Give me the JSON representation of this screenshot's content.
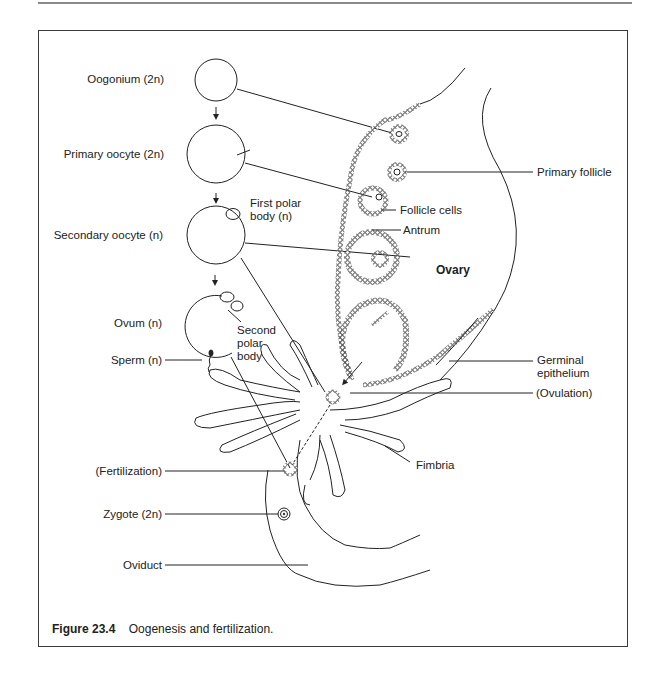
{
  "figure": {
    "number": "Figure 23.4",
    "caption": "Oogenesis and fertilization."
  },
  "stages": [
    {
      "label": "Oogonium (2n)"
    },
    {
      "label": "Primary oocyte (2n)"
    },
    {
      "label": "Secondary oocyte (n)"
    },
    {
      "label": "Ovum (n)"
    },
    {
      "label": "Sperm (n)"
    },
    {
      "label": "(Fertilization)"
    },
    {
      "label": "Zygote (2n)"
    },
    {
      "label": "Oviduct"
    }
  ],
  "annotations": {
    "first_polar_body": [
      "First polar",
      "body (n)"
    ],
    "second_polar_body": [
      "Second",
      "polar",
      "body"
    ],
    "primary_follicle": "Primary follicle",
    "follicle_cells": "Follicle cells",
    "antrum": "Antrum",
    "ovary": "Ovary",
    "germinal_epithelium": [
      "Germinal",
      "epithelium"
    ],
    "ovulation": "(Ovulation)",
    "fimbria": "Fimbria"
  },
  "colors": {
    "line": "#1a1a1a",
    "frame": "#3a3a3a",
    "rule": "#8a8a8a"
  }
}
